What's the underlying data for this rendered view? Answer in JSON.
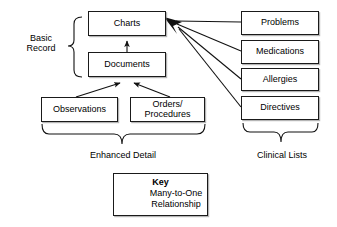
{
  "diagram": {
    "background_color": "#ffffff",
    "line_color": "#1a1a1a",
    "nodes": [
      {
        "id": "charts",
        "label": "Charts",
        "x": 88,
        "y": 11,
        "w": 78,
        "h": 25
      },
      {
        "id": "documents",
        "label": "Documents",
        "x": 88,
        "y": 52,
        "w": 78,
        "h": 25
      },
      {
        "id": "observations",
        "label": "Observations",
        "x": 41,
        "y": 97,
        "w": 77,
        "h": 25
      },
      {
        "id": "orders",
        "label": "Orders/\nProcedures",
        "x": 130,
        "y": 97,
        "w": 75,
        "h": 25
      },
      {
        "id": "problems",
        "label": "Problems",
        "x": 241,
        "y": 11,
        "w": 78,
        "h": 24
      },
      {
        "id": "medications",
        "label": "Medications",
        "x": 241,
        "y": 40,
        "w": 78,
        "h": 24
      },
      {
        "id": "allergies",
        "label": "Allergies",
        "x": 241,
        "y": 68,
        "w": 78,
        "h": 23
      },
      {
        "id": "directives",
        "label": "Directives",
        "x": 241,
        "y": 96,
        "w": 78,
        "h": 24
      }
    ],
    "group_labels": [
      {
        "id": "basic-record",
        "label": "Basic\nRecord",
        "x": 14,
        "y": 33,
        "w": 54
      },
      {
        "id": "enhanced-detail",
        "label": "Enhanced Detail",
        "x": 62,
        "y": 150,
        "w": 122
      },
      {
        "id": "clinical-lists",
        "label": "Clinical Lists",
        "x": 240,
        "y": 150,
        "w": 84
      }
    ],
    "key": {
      "id": "key-legend",
      "title": "Key",
      "text": "Many-to-One\nRelationship",
      "x": 113,
      "y": 173,
      "w": 95,
      "h": 43
    }
  }
}
